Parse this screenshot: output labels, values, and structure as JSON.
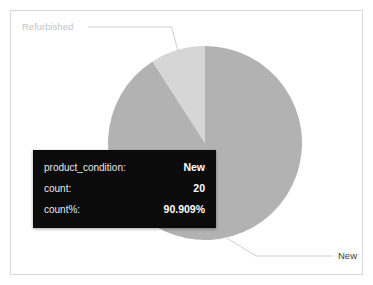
{
  "chart_data": {
    "type": "pie",
    "title": "",
    "categories": [
      "New",
      "Refurbished"
    ],
    "values": [
      20,
      2
    ],
    "percents": [
      90.909,
      9.091
    ],
    "colors": [
      "#b2b2b2",
      "#d6d6d6"
    ],
    "labels_position": "outside-with-leader-lines",
    "legend": "none",
    "grid": false,
    "series": [
      {
        "name": "count",
        "field": "product_condition",
        "values": [
          20,
          2
        ]
      }
    ],
    "annotations": [
      {
        "label": "Refurbished",
        "slice": "Refurbished",
        "anchor": "top-left"
      },
      {
        "label": "New",
        "slice": "New",
        "anchor": "bottom-right"
      }
    ]
  },
  "chart": {
    "slice_label_refurbished": "Refurbished",
    "slice_label_new": "New"
  },
  "tooltip": {
    "rows": [
      {
        "key": "product_condition:",
        "value": "New"
      },
      {
        "key": "count:",
        "value": "20"
      },
      {
        "key": "count%:",
        "value": "90.909%"
      }
    ]
  },
  "colors": {
    "slice_new": "#b2b2b2",
    "slice_refurbished": "#d6d6d6",
    "leader_line": "#c9c9c9",
    "frame_border": "#d8d8d8",
    "tooltip_bg": "#0b0b0b",
    "tooltip_text": "#ffffff",
    "label_muted": "#c3c3c3",
    "label_dark": "#3d3d3d"
  }
}
